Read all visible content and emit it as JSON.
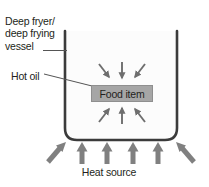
{
  "diagram": {
    "title": "Deep Frying",
    "labels": {
      "vessel": "Deep fryer/ deep frying vessel",
      "vessel_line1": "Deep fryer/",
      "vessel_line2": "deep frying",
      "vessel_line3": "vessel",
      "hot_oil": "Hot oil",
      "heat_source": "Heat source",
      "food_item": "Food item"
    },
    "colors": {
      "text": "#231f20",
      "vessel_outline": "#3b3b3b",
      "oil_fill": "#fcfcfc",
      "food_box_fill": "#a6a6a6",
      "food_box_border": "#8f8f8f",
      "heat_arrow": "#808080",
      "oil_arrow": "#6e6e6e",
      "leader_line": "#555555",
      "background": "#ffffff"
    },
    "elements": {
      "vessel_shape": "open-top rounded-bottom container",
      "oil_arrows_top": [
        "down-right",
        "down",
        "down-left"
      ],
      "oil_arrows_bottom": [
        "up-right",
        "up",
        "up-left"
      ],
      "heat_arrows": [
        "up-right",
        "up",
        "up",
        "up",
        "up",
        "up-left"
      ],
      "heat_arrow_count": 6,
      "oil_arrow_count": 6
    }
  }
}
